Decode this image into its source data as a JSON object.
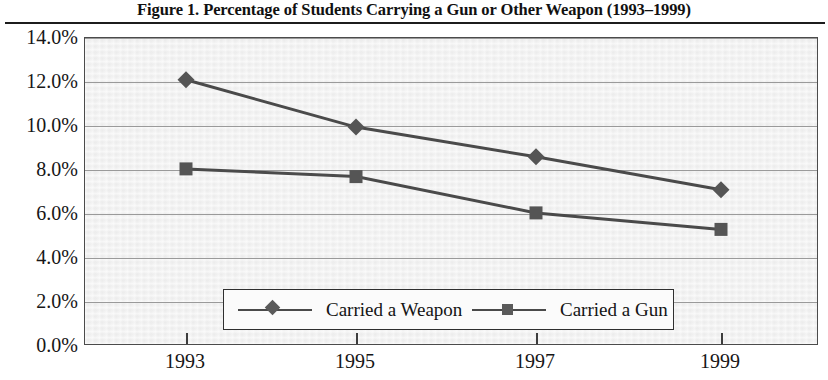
{
  "figure": {
    "title": "Figure 1.  Percentage of Students Carrying a Gun or Other Weapon (1993–1999)"
  },
  "legend": {
    "position": "inside-bottom-center",
    "entries": [
      {
        "label": "Carried a Weapon",
        "marker": "diamond-marker-icon"
      },
      {
        "label": "Carried a Gun",
        "marker": "square-marker-icon"
      }
    ]
  },
  "axes": {
    "y_tick_labels": [
      "14.0%",
      "12.0%",
      "10.0%",
      "8.0%",
      "6.0%",
      "4.0%",
      "2.0%",
      "0.0%"
    ],
    "x_tick_labels": [
      "1993",
      "1995",
      "1997",
      "1999"
    ]
  },
  "chart_data": {
    "type": "line",
    "title": "Figure 1.  Percentage of Students Carrying a Gun or Other Weapon (1993–1999)",
    "xlabel": "",
    "ylabel": "",
    "categories": [
      "1993",
      "1995",
      "1997",
      "1999"
    ],
    "x": [
      1993,
      1995,
      1997,
      1999
    ],
    "series": [
      {
        "name": "Carried a Weapon",
        "marker": "diamond",
        "values": [
          12.1,
          9.95,
          8.6,
          7.1
        ]
      },
      {
        "name": "Carried a Gun",
        "marker": "square",
        "values": [
          8.05,
          7.7,
          6.05,
          5.3
        ]
      }
    ],
    "ylim": [
      0.0,
      14.0
    ],
    "ytick_values": [
      0.0,
      2.0,
      4.0,
      6.0,
      8.0,
      10.0,
      12.0,
      14.0
    ],
    "ytick_format": "percent",
    "grid": "horizontal",
    "legend_position": "inside-bottom-center",
    "colors": {
      "series_line": "#4a4a4a",
      "plot_background": "#f1f1f1",
      "gridline": "#9a9a9a",
      "frame": "#4b4b4b"
    }
  }
}
